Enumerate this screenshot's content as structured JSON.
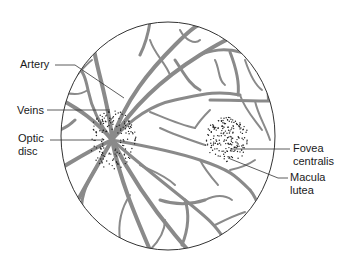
{
  "diagram": {
    "colors": {
      "background": "#ffffff",
      "outline": "#333333",
      "vessel": "#8a8a8a",
      "dots": "#222222",
      "leader": "#333333",
      "text": "#1a1a1a"
    },
    "fundus": {
      "cx": 168,
      "cy": 136,
      "rx": 107,
      "ry": 114
    },
    "optic_disc": {
      "cx": 112,
      "cy": 140
    },
    "macula": {
      "cx": 227,
      "cy": 140
    },
    "labels": [
      {
        "id": "artery",
        "text": "Artery",
        "x": 20,
        "y": 58,
        "leader": [
          [
            55,
            65
          ],
          [
            75,
            65
          ],
          [
            124,
            98
          ]
        ]
      },
      {
        "id": "veins",
        "text": "Veins",
        "x": 17,
        "y": 104,
        "leader": [
          [
            47,
            110
          ],
          [
            110,
            110
          ]
        ]
      },
      {
        "id": "optic-disc",
        "text": "Optic\ndisc",
        "x": 18,
        "y": 132,
        "leader": [
          [
            50,
            140
          ],
          [
            104,
            140
          ]
        ]
      },
      {
        "id": "fovea-centralis",
        "text": "Fovea\ncentralis",
        "x": 293,
        "y": 142,
        "leader": [
          [
            290,
            149
          ],
          [
            230,
            149
          ]
        ]
      },
      {
        "id": "macula-lutea",
        "text": "Macula\nlutea",
        "x": 290,
        "y": 171,
        "leader": [
          [
            288,
            178
          ],
          [
            278,
            178
          ],
          [
            228,
            158
          ]
        ]
      }
    ]
  }
}
